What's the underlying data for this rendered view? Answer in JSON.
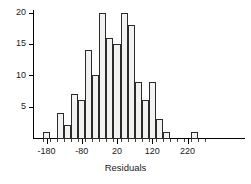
{
  "chart_data": {
    "type": "bar",
    "title": "",
    "subtitle": "",
    "xlabel": "Residuals",
    "ylabel": "",
    "grid": false,
    "legend": null,
    "xlim": [
      -190,
      290
    ],
    "ylim": [
      0,
      21
    ],
    "bin_width": 20,
    "x_tick_labels": [
      "-180",
      "-80",
      "20",
      "120",
      "220"
    ],
    "x_tick_values": [
      -180,
      -80,
      20,
      120,
      220
    ],
    "y_tick_labels": [
      "5",
      "10",
      "15",
      "20"
    ],
    "y_tick_values": [
      5,
      10,
      15,
      20
    ],
    "bin_starts": [
      -190,
      -170,
      -150,
      -130,
      -110,
      -90,
      -70,
      -50,
      -30,
      -10,
      10,
      30,
      50,
      70,
      90,
      110,
      130,
      150,
      170,
      190,
      210,
      230,
      250
    ],
    "bin_centers": [
      -180,
      -160,
      -140,
      -120,
      -100,
      -80,
      -60,
      -40,
      -20,
      0,
      20,
      40,
      60,
      80,
      100,
      120,
      140,
      160,
      180,
      200,
      220,
      240,
      260
    ],
    "categories": [
      "-190 to -170",
      "-170 to -150",
      "-150 to -130",
      "-130 to -110",
      "-110 to -90",
      "-90 to -70",
      "-70 to -50",
      "-50 to -30",
      "-30 to -10",
      "-10 to 10",
      "10 to 30",
      "30 to 50",
      "50 to 70",
      "70 to 90",
      "90 to 110",
      "110 to 130",
      "130 to 150",
      "150 to 170",
      "170 to 190",
      "190 to 210",
      "210 to 230",
      "230 to 250",
      "250 to 270"
    ],
    "values": [
      1,
      0,
      4,
      2,
      7,
      6,
      14,
      10,
      20,
      16,
      15,
      20,
      18,
      9,
      6,
      9,
      3,
      1,
      0,
      0,
      0,
      1,
      0
    ],
    "colors": {
      "bar_fill": "#f2f2f0",
      "bar_stroke": "#2b2b2b",
      "axis": "#000000",
      "text": "#1a1a1a",
      "background": "#ffffff"
    }
  }
}
